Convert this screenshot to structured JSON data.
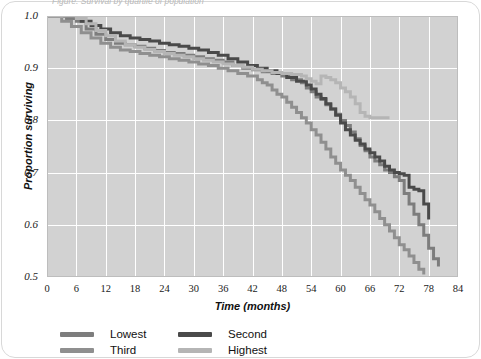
{
  "caption": "Figure: Survival by quartile of population",
  "chart_data": {
    "type": "line",
    "title": "",
    "subtitle": "",
    "xlabel": "Time (months)",
    "ylabel": "Proportion surviving",
    "xlim": [
      0,
      84
    ],
    "ylim": [
      0.5,
      1.0
    ],
    "xticks": [
      "0",
      "6",
      "12",
      "18",
      "24",
      "30",
      "36",
      "42",
      "48",
      "54",
      "60",
      "66",
      "72",
      "78",
      "84"
    ],
    "yticks": [
      "1.0",
      "0.9",
      "0.8",
      "0.7",
      "0.6",
      "0.5"
    ],
    "grid": "both-white",
    "legend_position": "below",
    "plot_background": "#d2d2d2",
    "series": [
      {
        "name": "Lowest",
        "color": "#7d7d7d",
        "points": [
          [
            0,
            1.0
          ],
          [
            3,
            1.0
          ],
          [
            4,
            0.995
          ],
          [
            6,
            0.99
          ],
          [
            8,
            0.975
          ],
          [
            10,
            0.965
          ],
          [
            12,
            0.955
          ],
          [
            14,
            0.948
          ],
          [
            16,
            0.945
          ],
          [
            18,
            0.942
          ],
          [
            20,
            0.938
          ],
          [
            22,
            0.934
          ],
          [
            24,
            0.93
          ],
          [
            26,
            0.928
          ],
          [
            28,
            0.925
          ],
          [
            30,
            0.922
          ],
          [
            32,
            0.918
          ],
          [
            34,
            0.915
          ],
          [
            36,
            0.912
          ],
          [
            38,
            0.905
          ],
          [
            40,
            0.9
          ],
          [
            42,
            0.897
          ],
          [
            44,
            0.893
          ],
          [
            46,
            0.89
          ],
          [
            48,
            0.885
          ],
          [
            50,
            0.878
          ],
          [
            52,
            0.872
          ],
          [
            53,
            0.862
          ],
          [
            54,
            0.855
          ],
          [
            55,
            0.845
          ],
          [
            56,
            0.84
          ],
          [
            57,
            0.83
          ],
          [
            58,
            0.822
          ],
          [
            59,
            0.812
          ],
          [
            60,
            0.8
          ],
          [
            61,
            0.79
          ],
          [
            62,
            0.778
          ],
          [
            63,
            0.765
          ],
          [
            64,
            0.752
          ],
          [
            65,
            0.742
          ],
          [
            66,
            0.73
          ],
          [
            67,
            0.722
          ],
          [
            68,
            0.715
          ],
          [
            69,
            0.705
          ],
          [
            70,
            0.7
          ],
          [
            71,
            0.692
          ],
          [
            72,
            0.685
          ],
          [
            73,
            0.66
          ],
          [
            74,
            0.64
          ],
          [
            75,
            0.62
          ],
          [
            76,
            0.6
          ],
          [
            77,
            0.58
          ],
          [
            78,
            0.555
          ],
          [
            79,
            0.535
          ],
          [
            80,
            0.52
          ]
        ]
      },
      {
        "name": "Second",
        "color": "#4a4a4a",
        "points": [
          [
            0,
            1.0
          ],
          [
            5,
            1.0
          ],
          [
            7,
            0.99
          ],
          [
            9,
            0.982
          ],
          [
            11,
            0.975
          ],
          [
            13,
            0.968
          ],
          [
            15,
            0.962
          ],
          [
            17,
            0.958
          ],
          [
            19,
            0.955
          ],
          [
            21,
            0.952
          ],
          [
            23,
            0.948
          ],
          [
            25,
            0.945
          ],
          [
            27,
            0.942
          ],
          [
            29,
            0.938
          ],
          [
            31,
            0.935
          ],
          [
            33,
            0.93
          ],
          [
            35,
            0.925
          ],
          [
            37,
            0.918
          ],
          [
            39,
            0.912
          ],
          [
            41,
            0.905
          ],
          [
            43,
            0.9
          ],
          [
            45,
            0.895
          ],
          [
            47,
            0.89
          ],
          [
            49,
            0.882
          ],
          [
            51,
            0.875
          ],
          [
            53,
            0.868
          ],
          [
            54,
            0.86
          ],
          [
            55,
            0.85
          ],
          [
            56,
            0.842
          ],
          [
            57,
            0.832
          ],
          [
            58,
            0.822
          ],
          [
            59,
            0.81
          ],
          [
            60,
            0.795
          ],
          [
            61,
            0.782
          ],
          [
            62,
            0.772
          ],
          [
            63,
            0.762
          ],
          [
            64,
            0.755
          ],
          [
            65,
            0.745
          ],
          [
            66,
            0.738
          ],
          [
            67,
            0.73
          ],
          [
            68,
            0.722
          ],
          [
            69,
            0.712
          ],
          [
            70,
            0.705
          ],
          [
            71,
            0.7
          ],
          [
            72,
            0.698
          ],
          [
            73,
            0.695
          ],
          [
            74,
            0.672
          ],
          [
            75,
            0.668
          ],
          [
            76,
            0.665
          ],
          [
            77,
            0.64
          ],
          [
            78,
            0.61
          ]
        ]
      },
      {
        "name": "Third",
        "color": "#8f8f8f",
        "points": [
          [
            0,
            1.0
          ],
          [
            2,
            1.0
          ],
          [
            3,
            0.99
          ],
          [
            5,
            0.98
          ],
          [
            7,
            0.968
          ],
          [
            9,
            0.958
          ],
          [
            11,
            0.948
          ],
          [
            13,
            0.94
          ],
          [
            15,
            0.935
          ],
          [
            17,
            0.932
          ],
          [
            19,
            0.928
          ],
          [
            21,
            0.925
          ],
          [
            23,
            0.922
          ],
          [
            25,
            0.918
          ],
          [
            27,
            0.915
          ],
          [
            29,
            0.912
          ],
          [
            31,
            0.908
          ],
          [
            33,
            0.905
          ],
          [
            35,
            0.9
          ],
          [
            37,
            0.895
          ],
          [
            39,
            0.89
          ],
          [
            41,
            0.885
          ],
          [
            43,
            0.878
          ],
          [
            44,
            0.872
          ],
          [
            45,
            0.868
          ],
          [
            46,
            0.858
          ],
          [
            47,
            0.85
          ],
          [
            48,
            0.845
          ],
          [
            49,
            0.835
          ],
          [
            50,
            0.825
          ],
          [
            51,
            0.815
          ],
          [
            52,
            0.805
          ],
          [
            53,
            0.795
          ],
          [
            54,
            0.782
          ],
          [
            55,
            0.772
          ],
          [
            56,
            0.758
          ],
          [
            57,
            0.745
          ],
          [
            58,
            0.73
          ],
          [
            59,
            0.718
          ],
          [
            60,
            0.705
          ],
          [
            61,
            0.695
          ],
          [
            62,
            0.685
          ],
          [
            63,
            0.672
          ],
          [
            64,
            0.66
          ],
          [
            65,
            0.648
          ],
          [
            66,
            0.638
          ],
          [
            67,
            0.625
          ],
          [
            68,
            0.612
          ],
          [
            69,
            0.6
          ],
          [
            70,
            0.588
          ],
          [
            71,
            0.575
          ],
          [
            72,
            0.562
          ],
          [
            73,
            0.552
          ],
          [
            74,
            0.54
          ],
          [
            75,
            0.528
          ],
          [
            76,
            0.515
          ],
          [
            77,
            0.505
          ]
        ]
      },
      {
        "name": "Highest",
        "color": "#b5b5b5",
        "points": [
          [
            0,
            1.0
          ],
          [
            4,
            1.0
          ],
          [
            6,
            0.995
          ],
          [
            8,
            0.985
          ],
          [
            10,
            0.972
          ],
          [
            12,
            0.962
          ],
          [
            14,
            0.952
          ],
          [
            16,
            0.945
          ],
          [
            18,
            0.94
          ],
          [
            20,
            0.936
          ],
          [
            22,
            0.932
          ],
          [
            24,
            0.928
          ],
          [
            26,
            0.925
          ],
          [
            28,
            0.922
          ],
          [
            30,
            0.918
          ],
          [
            32,
            0.915
          ],
          [
            34,
            0.912
          ],
          [
            36,
            0.908
          ],
          [
            38,
            0.905
          ],
          [
            40,
            0.902
          ],
          [
            42,
            0.898
          ],
          [
            44,
            0.895
          ],
          [
            46,
            0.892
          ],
          [
            48,
            0.89
          ],
          [
            50,
            0.888
          ],
          [
            52,
            0.885
          ],
          [
            53,
            0.88
          ],
          [
            54,
            0.875
          ],
          [
            55,
            0.87
          ],
          [
            56,
            0.885
          ],
          [
            57,
            0.882
          ],
          [
            58,
            0.878
          ],
          [
            59,
            0.872
          ],
          [
            60,
            0.862
          ],
          [
            61,
            0.855
          ],
          [
            62,
            0.845
          ],
          [
            63,
            0.832
          ],
          [
            64,
            0.815
          ],
          [
            65,
            0.808
          ],
          [
            66,
            0.805
          ],
          [
            68,
            0.805
          ],
          [
            70,
            0.805
          ]
        ]
      }
    ]
  },
  "legend": {
    "items": [
      {
        "label": "Lowest",
        "color": "#7d7d7d"
      },
      {
        "label": "Second",
        "color": "#4a4a4a"
      },
      {
        "label": "Third",
        "color": "#8f8f8f"
      },
      {
        "label": "Highest",
        "color": "#b5b5b5"
      }
    ]
  }
}
